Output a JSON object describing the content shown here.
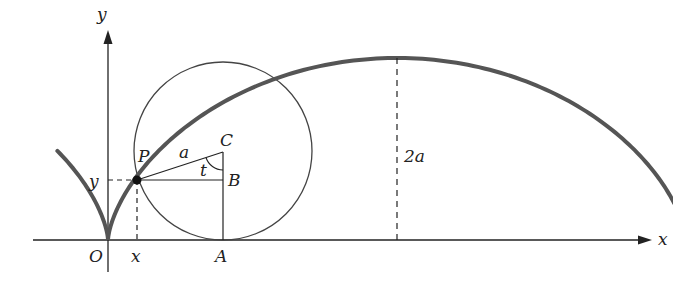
{
  "figure": {
    "labels": {
      "y_axis": "y",
      "x_axis": "x",
      "origin": "O",
      "x_coord": "x",
      "y_coord": "y",
      "point_P": "P",
      "point_C": "C",
      "point_B": "B",
      "point_A": "A",
      "radius": "a",
      "angle": "t",
      "height": "2a"
    },
    "colors": {
      "cycloid": "#555555",
      "lines": "#222222",
      "background": "#ffffff"
    }
  }
}
